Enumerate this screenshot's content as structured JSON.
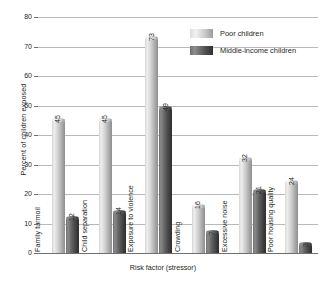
{
  "chart_data": {
    "type": "bar",
    "title": "",
    "xlabel": "Risk factor (stressor)",
    "ylabel": "Percent of children exposed",
    "ylim": [
      0,
      80
    ],
    "yticks": [
      0,
      10,
      20,
      30,
      40,
      50,
      60,
      70,
      80
    ],
    "grid": true,
    "legend_position": "top-right",
    "categories": [
      "Family turmoil",
      "Child separation",
      "Exposure to violence",
      "Crowding",
      "Excessive noise",
      "Poor housing quality"
    ],
    "series": [
      {
        "name": "Poor children",
        "color": "#cfcfcf",
        "values": [
          45,
          45,
          73,
          16,
          32,
          24
        ]
      },
      {
        "name": "Middle-income children",
        "color": "#4a4a4a",
        "values": [
          12,
          14,
          49,
          7,
          21,
          3
        ]
      }
    ]
  },
  "legend": {
    "items": [
      {
        "label": "Poor children"
      },
      {
        "label": "Middle-income children"
      }
    ]
  },
  "axes": {
    "y_tick_labels": [
      "80",
      "70",
      "60",
      "50",
      "40",
      "30",
      "20",
      "10",
      "0"
    ],
    "y_axis_title": "Percent of children exposed",
    "x_axis_title": "Risk factor (stressor)"
  }
}
